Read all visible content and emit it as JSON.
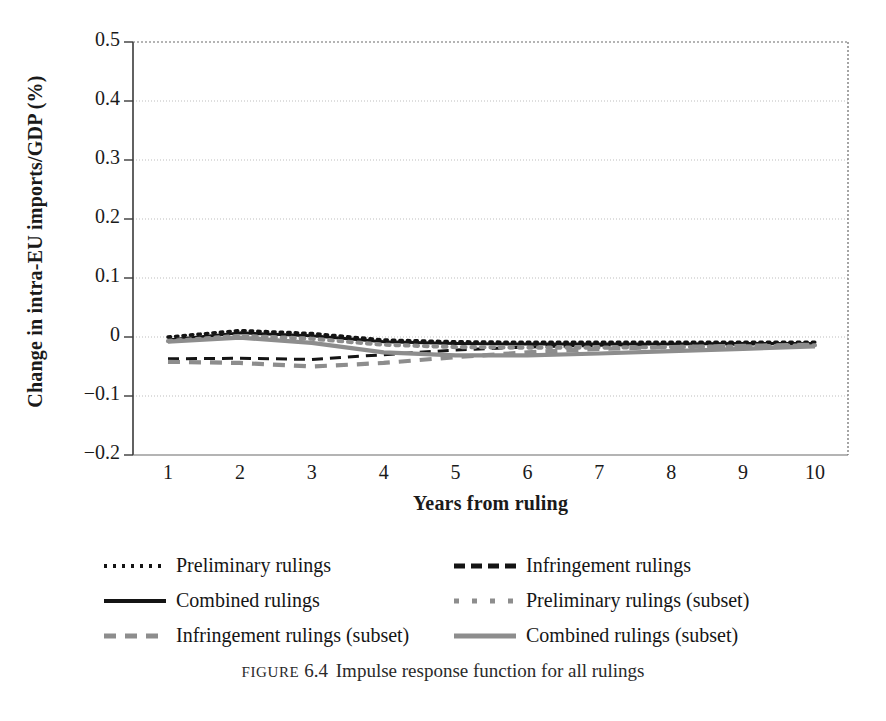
{
  "figure": {
    "caption_kicker": "Figure",
    "caption_number": "6.4",
    "caption_text": "Impulse response function for all rulings"
  },
  "axes": {
    "y_title": "Change in intra-EU imports/GDP (%)",
    "x_title": "Years from ruling",
    "y_ticks": [
      "0.5",
      "0.4",
      "0.3",
      "0.2",
      "0.1",
      "0",
      "−0.1",
      "−0.2"
    ],
    "x_ticks": [
      "1",
      "2",
      "3",
      "4",
      "5",
      "6",
      "7",
      "8",
      "9",
      "10"
    ]
  },
  "legend": {
    "items": [
      {
        "label": "Preliminary rulings",
        "style": "dotted-black",
        "color": "#141414"
      },
      {
        "label": "Infringement rulings",
        "style": "dashed-black",
        "color": "#141414"
      },
      {
        "label": "Combined rulings",
        "style": "solid-black",
        "color": "#141414"
      },
      {
        "label": "Preliminary rulings (subset)",
        "style": "dotted-gray",
        "color": "#8d8d8d"
      },
      {
        "label": "Infringement rulings (subset)",
        "style": "dashed-gray",
        "color": "#8d8d8d"
      },
      {
        "label": "Combined rulings (subset)",
        "style": "solid-gray",
        "color": "#8d8d8d"
      }
    ]
  },
  "chart_data": {
    "type": "line",
    "title": "Impulse response function for all rulings",
    "xlabel": "Years from ruling",
    "ylabel": "Change in intra-EU imports/GDP (%)",
    "xlim": [
      1,
      10
    ],
    "ylim": [
      -0.2,
      0.5
    ],
    "ytick_values": [
      0.5,
      0.4,
      0.3,
      0.2,
      0.1,
      0,
      -0.1,
      -0.2
    ],
    "grid": true,
    "legend_position": "below-plot",
    "x": [
      1,
      2,
      3,
      4,
      5,
      6,
      7,
      8,
      9,
      10
    ],
    "series": [
      {
        "name": "Preliminary rulings",
        "style": "dotted",
        "color": "#141414",
        "values": [
          0.0,
          0.011,
          0.006,
          -0.005,
          -0.008,
          -0.009,
          -0.009,
          -0.009,
          -0.009,
          -0.009
        ]
      },
      {
        "name": "Infringement rulings",
        "style": "dashed",
        "color": "#141414",
        "values": [
          -0.037,
          -0.036,
          -0.038,
          -0.03,
          -0.022,
          -0.017,
          -0.014,
          -0.013,
          -0.012,
          -0.011
        ]
      },
      {
        "name": "Combined rulings",
        "style": "solid",
        "color": "#141414",
        "values": [
          -0.005,
          0.007,
          0.002,
          -0.008,
          -0.011,
          -0.012,
          -0.012,
          -0.012,
          -0.011,
          -0.011
        ]
      },
      {
        "name": "Preliminary rulings (subset)",
        "style": "dotted",
        "color": "#8d8d8d",
        "values": [
          -0.007,
          0.002,
          -0.003,
          -0.013,
          -0.017,
          -0.018,
          -0.018,
          -0.017,
          -0.016,
          -0.014
        ]
      },
      {
        "name": "Infringement rulings (subset)",
        "style": "dashed",
        "color": "#8d8d8d",
        "values": [
          -0.042,
          -0.044,
          -0.05,
          -0.044,
          -0.034,
          -0.026,
          -0.02,
          -0.017,
          -0.015,
          -0.013
        ]
      },
      {
        "name": "Combined rulings (subset)",
        "style": "solid",
        "color": "#8d8d8d",
        "values": [
          -0.008,
          -0.001,
          -0.01,
          -0.026,
          -0.031,
          -0.031,
          -0.028,
          -0.024,
          -0.02,
          -0.016
        ]
      }
    ]
  }
}
